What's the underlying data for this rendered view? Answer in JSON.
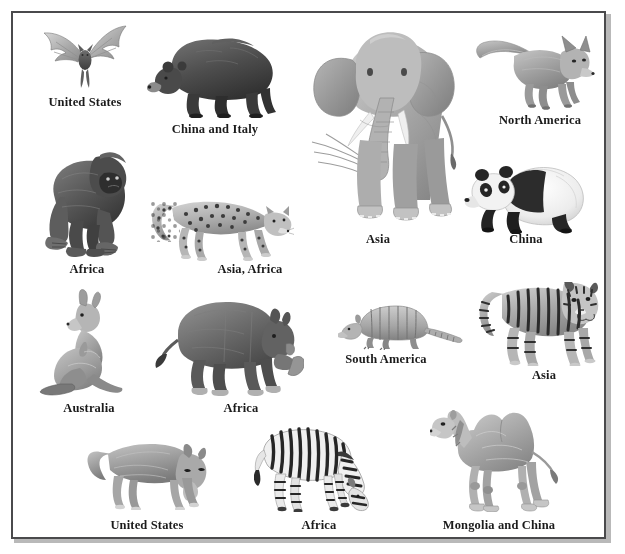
{
  "page": {
    "kind": "illustrated-plate",
    "background_color": "#ffffff",
    "frame_color": "#4a4a4c",
    "frame_shadow_color": "#b9b9b9",
    "label_color": "#1b1b1b",
    "art_style": "grayscale-pencil-illustration"
  },
  "animals": [
    {
      "id": "bat",
      "icon": "bat-icon",
      "label": "United States",
      "art": {
        "x": 38,
        "y": 24,
        "w": 92,
        "h": 72
      },
      "label_box": {
        "x": 30,
        "y": 95,
        "w": 110,
        "h": 15
      }
    },
    {
      "id": "bear",
      "icon": "bear-icon",
      "label": "China and Italy",
      "art": {
        "x": 146,
        "y": 28,
        "w": 136,
        "h": 90
      },
      "label_box": {
        "x": 154,
        "y": 122,
        "w": 122,
        "h": 15
      }
    },
    {
      "id": "elephant",
      "icon": "elephant-icon",
      "label": "Asia",
      "art": {
        "x": 308,
        "y": 20,
        "w": 160,
        "h": 212
      },
      "label_box": {
        "x": 338,
        "y": 232,
        "w": 80,
        "h": 15
      }
    },
    {
      "id": "fox",
      "icon": "fox-icon",
      "label": "North America",
      "art": {
        "x": 474,
        "y": 34,
        "w": 122,
        "h": 76
      },
      "label_box": {
        "x": 478,
        "y": 113,
        "w": 124,
        "h": 15
      }
    },
    {
      "id": "gorilla",
      "icon": "gorilla-icon",
      "label": "Africa",
      "art": {
        "x": 38,
        "y": 145,
        "w": 94,
        "h": 114
      },
      "label_box": {
        "x": 44,
        "y": 262,
        "w": 86,
        "h": 15
      }
    },
    {
      "id": "leopard",
      "icon": "leopard-icon",
      "label": "Asia, Africa",
      "art": {
        "x": 150,
        "y": 190,
        "w": 144,
        "h": 72
      },
      "label_box": {
        "x": 198,
        "y": 262,
        "w": 104,
        "h": 15
      }
    },
    {
      "id": "panda",
      "icon": "panda-icon",
      "label": "China",
      "art": {
        "x": 460,
        "y": 148,
        "w": 128,
        "h": 86
      },
      "label_box": {
        "x": 490,
        "y": 232,
        "w": 72,
        "h": 15
      }
    },
    {
      "id": "kangaroo",
      "icon": "kangaroo-icon",
      "label": "Australia",
      "art": {
        "x": 38,
        "y": 288,
        "w": 92,
        "h": 110
      },
      "label_box": {
        "x": 42,
        "y": 401,
        "w": 94,
        "h": 15
      }
    },
    {
      "id": "rhinoceros",
      "icon": "rhinoceros-icon",
      "label": "Africa",
      "art": {
        "x": 152,
        "y": 292,
        "w": 152,
        "h": 104
      },
      "label_box": {
        "x": 198,
        "y": 401,
        "w": 86,
        "h": 15
      }
    },
    {
      "id": "armadillo",
      "icon": "armadillo-icon",
      "label": "South America",
      "art": {
        "x": 338,
        "y": 302,
        "w": 126,
        "h": 48
      },
      "label_box": {
        "x": 324,
        "y": 352,
        "w": 124,
        "h": 15
      }
    },
    {
      "id": "tiger",
      "icon": "tiger-icon",
      "label": "Asia",
      "art": {
        "x": 478,
        "y": 282,
        "w": 122,
        "h": 84
      },
      "label_box": {
        "x": 504,
        "y": 368,
        "w": 80,
        "h": 15
      }
    },
    {
      "id": "wolf",
      "icon": "wolf-icon",
      "label": "United States",
      "art": {
        "x": 86,
        "y": 436,
        "w": 128,
        "h": 74
      },
      "label_box": {
        "x": 92,
        "y": 518,
        "w": 110,
        "h": 15
      }
    },
    {
      "id": "zebra",
      "icon": "zebra-icon",
      "label": "Africa",
      "art": {
        "x": 254,
        "y": 426,
        "w": 130,
        "h": 86
      },
      "label_box": {
        "x": 276,
        "y": 518,
        "w": 86,
        "h": 15
      }
    },
    {
      "id": "camel",
      "icon": "camel-icon",
      "label": "Mongolia and China",
      "art": {
        "x": 430,
        "y": 400,
        "w": 130,
        "h": 112
      },
      "label_box": {
        "x": 436,
        "y": 518,
        "w": 126,
        "h": 15
      }
    }
  ]
}
